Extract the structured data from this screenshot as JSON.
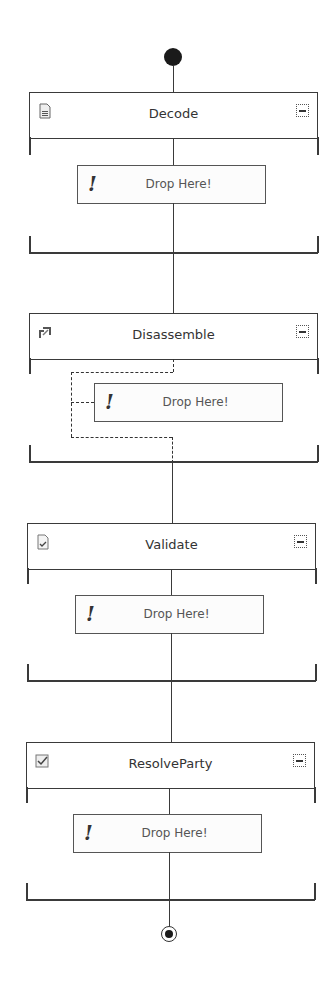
{
  "pipeline": {
    "start_node": "start-marker",
    "end_node": "end-marker",
    "stages": [
      {
        "name": "Decode",
        "icon": "decode-document-icon",
        "collapse_label": "−",
        "drop_label": "Drop Here!",
        "drop_icon": "!"
      },
      {
        "name": "Disassemble",
        "icon": "disassemble-icon",
        "collapse_label": "−",
        "drop_label": "Drop Here!",
        "drop_icon": "!"
      },
      {
        "name": "Validate",
        "icon": "validate-document-icon",
        "collapse_label": "−",
        "drop_label": "Drop Here!",
        "drop_icon": "!"
      },
      {
        "name": "ResolveParty",
        "icon": "resolve-party-checkbox-icon",
        "collapse_label": "−",
        "drop_label": "Drop Here!",
        "drop_icon": "!"
      }
    ]
  },
  "colors": {
    "line": "#3a3a3a",
    "node": "#1a1a1a",
    "background": "#ffffff"
  }
}
